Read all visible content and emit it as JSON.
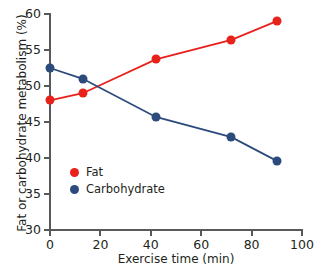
{
  "chart_data": {
    "type": "line",
    "title": "",
    "xlabel": "Exercise time (min)",
    "ylabel": "Fat or carbohydrate metabolism (%)",
    "xlim": [
      0,
      100
    ],
    "ylim": [
      30,
      60
    ],
    "xticks": [
      0,
      20,
      40,
      60,
      80,
      100
    ],
    "yticks": [
      30,
      35,
      40,
      45,
      50,
      55,
      60
    ],
    "grid": false,
    "legend_position": "inside-lower-left",
    "series": [
      {
        "name": "Fat",
        "color": "#E8211A",
        "x": [
          0,
          13,
          42,
          72,
          90
        ],
        "values": [
          48.0,
          49.0,
          53.7,
          56.4,
          59.0
        ]
      },
      {
        "name": "Carbohydrate",
        "color": "#2C4B7C",
        "x": [
          0,
          13,
          42,
          72,
          90
        ],
        "values": [
          52.5,
          51.0,
          45.7,
          42.9,
          39.6
        ]
      }
    ]
  },
  "legend": {
    "items": [
      {
        "label": "Fat",
        "color": "#E8211A"
      },
      {
        "label": "Carbohydrate",
        "color": "#2C4B7C"
      }
    ]
  },
  "axis_colors": {
    "axis_line": "#58595b",
    "tick_text": "#231f20"
  }
}
